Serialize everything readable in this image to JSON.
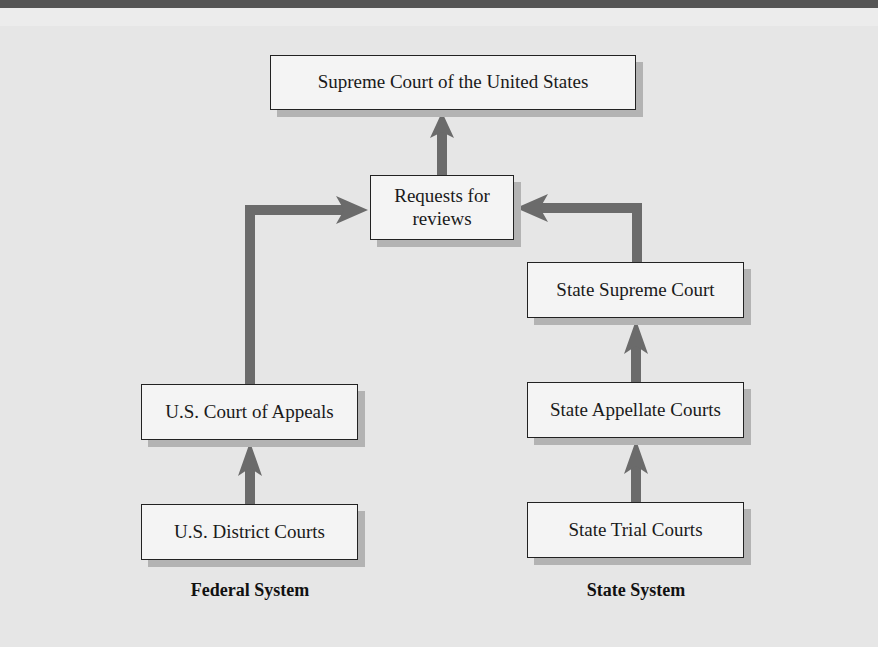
{
  "diagram": {
    "boxes": {
      "supreme_court_us": "Supreme Court of the United States",
      "requests_for_reviews": "Requests for reviews",
      "state_supreme_court": "State Supreme Court",
      "state_appellate_courts": "State Appellate Courts",
      "state_trial_courts": "State Trial Courts",
      "us_court_of_appeals": "U.S. Court of Appeals",
      "us_district_courts": "U.S. District Courts"
    },
    "labels": {
      "federal": "Federal System",
      "state": "State System"
    },
    "edges": [
      {
        "from": "U.S. District Courts",
        "to": "U.S. Court of Appeals"
      },
      {
        "from": "U.S. Court of Appeals",
        "to": "Requests for reviews"
      },
      {
        "from": "State Trial Courts",
        "to": "State Appellate Courts"
      },
      {
        "from": "State Appellate Courts",
        "to": "State Supreme Court"
      },
      {
        "from": "State Supreme Court",
        "to": "Requests for reviews"
      },
      {
        "from": "Requests for reviews",
        "to": "Supreme Court of the United States"
      }
    ],
    "colors": {
      "arrow": "#6b6b6b",
      "box_fill": "#f4f4f4",
      "box_border": "#222222",
      "shadow": "#b3b3b3",
      "background": "#e6e6e6"
    }
  }
}
